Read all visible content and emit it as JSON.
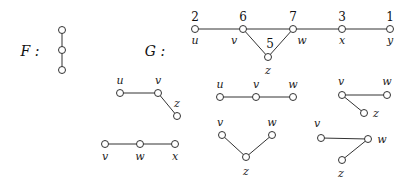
{
  "graphs": {
    "F": {
      "label": "F :",
      "label_pos": [
        22,
        56
      ],
      "nodes": [
        {
          "id": "f1",
          "x": 62,
          "y": 30
        },
        {
          "id": "f2",
          "x": 62,
          "y": 50
        },
        {
          "id": "f3",
          "x": 62,
          "y": 70
        }
      ],
      "edges": [
        [
          "f1",
          "f2"
        ],
        [
          "f2",
          "f3"
        ]
      ]
    },
    "G": {
      "label": "G :",
      "label_pos": [
        147,
        56
      ],
      "nodes": [
        {
          "id": "u",
          "x": 195,
          "y": 29,
          "name": "u",
          "number": "2"
        },
        {
          "id": "v",
          "x": 243,
          "y": 29,
          "name": "v",
          "number": "6"
        },
        {
          "id": "z",
          "x": 268,
          "y": 57,
          "name": "z",
          "number": "5"
        },
        {
          "id": "w",
          "x": 293,
          "y": 29,
          "name": "w",
          "number": "7"
        },
        {
          "id": "x",
          "x": 342,
          "y": 29,
          "name": "x",
          "number": "3"
        },
        {
          "id": "y",
          "x": 390,
          "y": 29,
          "name": "y",
          "number": "1"
        }
      ],
      "edges": [
        [
          "u",
          "v"
        ],
        [
          "v",
          "w"
        ],
        [
          "v",
          "z"
        ],
        [
          "z",
          "w"
        ],
        [
          "w",
          "x"
        ],
        [
          "x",
          "y"
        ]
      ]
    }
  },
  "subgraphs": [
    {
      "name": "uvz",
      "nodes": [
        {
          "id": "u",
          "x": 120,
          "y": 93,
          "name": "u",
          "lx": 120,
          "ly": 84
        },
        {
          "id": "v",
          "x": 158,
          "y": 93,
          "name": "v",
          "lx": 158,
          "ly": 84
        },
        {
          "id": "z",
          "x": 177,
          "y": 116,
          "name": "z",
          "lx": 177,
          "ly": 107
        }
      ],
      "edges": [
        [
          "u",
          "v"
        ],
        [
          "v",
          "z"
        ]
      ]
    },
    {
      "name": "vwx",
      "nodes": [
        {
          "id": "v",
          "x": 105,
          "y": 144,
          "name": "v",
          "lx": 105,
          "ly": 160
        },
        {
          "id": "w",
          "x": 140,
          "y": 144,
          "name": "w",
          "lx": 140,
          "ly": 160
        },
        {
          "id": "x",
          "x": 175,
          "y": 144,
          "name": "x",
          "lx": 175,
          "ly": 160
        }
      ],
      "edges": [
        [
          "v",
          "w"
        ],
        [
          "w",
          "x"
        ]
      ]
    },
    {
      "name": "uvw",
      "nodes": [
        {
          "id": "u",
          "x": 220,
          "y": 97,
          "name": "u",
          "lx": 220,
          "ly": 88
        },
        {
          "id": "v",
          "x": 256,
          "y": 97,
          "name": "v",
          "lx": 256,
          "ly": 88
        },
        {
          "id": "w",
          "x": 293,
          "y": 97,
          "name": "w",
          "lx": 293,
          "ly": 88
        }
      ],
      "edges": [
        [
          "u",
          "v"
        ],
        [
          "v",
          "w"
        ]
      ]
    },
    {
      "name": "vzw",
      "nodes": [
        {
          "id": "v",
          "x": 222,
          "y": 135,
          "name": "v",
          "lx": 220,
          "ly": 126
        },
        {
          "id": "z",
          "x": 246,
          "y": 157,
          "name": "z",
          "lx": 246,
          "ly": 175
        },
        {
          "id": "w",
          "x": 272,
          "y": 135,
          "name": "w",
          "lx": 272,
          "ly": 126
        }
      ],
      "edges": [
        [
          "v",
          "z"
        ],
        [
          "z",
          "w"
        ]
      ]
    },
    {
      "name": "vwz-a",
      "nodes": [
        {
          "id": "v",
          "x": 342,
          "y": 95,
          "name": "v",
          "lx": 341,
          "ly": 85
        },
        {
          "id": "w",
          "x": 387,
          "y": 95,
          "name": "w",
          "lx": 387,
          "ly": 85
        },
        {
          "id": "z",
          "x": 364,
          "y": 113,
          "name": "z",
          "lx": 376,
          "ly": 117
        }
      ],
      "edges": [
        [
          "v",
          "w"
        ],
        [
          "v",
          "z"
        ]
      ]
    },
    {
      "name": "vwz-b",
      "nodes": [
        {
          "id": "v",
          "x": 321,
          "y": 138,
          "name": "v",
          "lx": 317,
          "ly": 127
        },
        {
          "id": "w",
          "x": 368,
          "y": 139,
          "name": "w",
          "lx": 382,
          "ly": 143
        },
        {
          "id": "z",
          "x": 342,
          "y": 160,
          "name": "z",
          "lx": 341,
          "ly": 177
        }
      ],
      "edges": [
        [
          "v",
          "w"
        ],
        [
          "w",
          "z"
        ]
      ]
    }
  ],
  "style": {
    "stroke": "#333333",
    "node_fill": "#ffffff",
    "node_radius": 3.5
  }
}
